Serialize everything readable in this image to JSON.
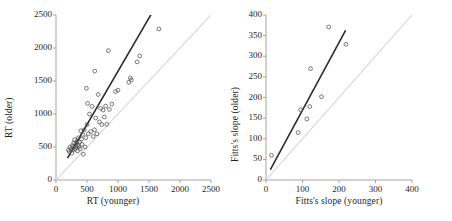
{
  "figure": {
    "background": "#ffffff",
    "ink": "#231f20",
    "fit_line_color": "#2b2b2b",
    "identity_line_color": "#d5d5d5",
    "marker_color": "#4d4d4d",
    "marker": "open-circle"
  },
  "chart_data": [
    {
      "type": "scatter",
      "title": "",
      "xlabel": "RT (younger)",
      "ylabel": "RT (older)",
      "xlim": [
        0,
        2500
      ],
      "ylim": [
        0,
        2500
      ],
      "xticks": [
        0,
        500,
        1000,
        1500,
        2000,
        2500
      ],
      "yticks": [
        0,
        500,
        1000,
        1500,
        2000,
        2500
      ],
      "xticklabels": [
        "0",
        "500",
        "1000",
        "1500",
        "2000",
        "2500"
      ],
      "yticklabels": [
        "0",
        "500",
        "1000",
        "1500",
        "2000",
        "2500"
      ],
      "grid": false,
      "legend": "none",
      "annotations": [],
      "lines": [
        {
          "name": "regression-fit",
          "style": "solid-dark",
          "x": [
            185,
            1540
          ],
          "y": [
            330,
            2520
          ]
        },
        {
          "name": "identity-line",
          "style": "solid-light",
          "x": [
            0,
            2500
          ],
          "y": [
            0,
            2500
          ]
        }
      ],
      "points": [
        {
          "x": 200,
          "y": 455
        },
        {
          "x": 215,
          "y": 430
        },
        {
          "x": 225,
          "y": 500
        },
        {
          "x": 245,
          "y": 470
        },
        {
          "x": 255,
          "y": 405
        },
        {
          "x": 265,
          "y": 520
        },
        {
          "x": 275,
          "y": 455
        },
        {
          "x": 285,
          "y": 560
        },
        {
          "x": 295,
          "y": 505
        },
        {
          "x": 300,
          "y": 610
        },
        {
          "x": 310,
          "y": 470
        },
        {
          "x": 320,
          "y": 545
        },
        {
          "x": 330,
          "y": 500
        },
        {
          "x": 340,
          "y": 585
        },
        {
          "x": 345,
          "y": 440
        },
        {
          "x": 355,
          "y": 530
        },
        {
          "x": 360,
          "y": 640
        },
        {
          "x": 370,
          "y": 505
        },
        {
          "x": 380,
          "y": 575
        },
        {
          "x": 390,
          "y": 470
        },
        {
          "x": 400,
          "y": 745
        },
        {
          "x": 410,
          "y": 620
        },
        {
          "x": 420,
          "y": 540
        },
        {
          "x": 430,
          "y": 690
        },
        {
          "x": 440,
          "y": 390
        },
        {
          "x": 455,
          "y": 760
        },
        {
          "x": 470,
          "y": 500
        },
        {
          "x": 480,
          "y": 640
        },
        {
          "x": 490,
          "y": 1390
        },
        {
          "x": 500,
          "y": 840
        },
        {
          "x": 510,
          "y": 1160
        },
        {
          "x": 520,
          "y": 700
        },
        {
          "x": 540,
          "y": 1000
        },
        {
          "x": 560,
          "y": 735
        },
        {
          "x": 580,
          "y": 1115
        },
        {
          "x": 600,
          "y": 660
        },
        {
          "x": 620,
          "y": 760
        },
        {
          "x": 625,
          "y": 1650
        },
        {
          "x": 640,
          "y": 940
        },
        {
          "x": 660,
          "y": 700
        },
        {
          "x": 680,
          "y": 1295
        },
        {
          "x": 700,
          "y": 880
        },
        {
          "x": 720,
          "y": 1085
        },
        {
          "x": 740,
          "y": 840
        },
        {
          "x": 760,
          "y": 1060
        },
        {
          "x": 780,
          "y": 955
        },
        {
          "x": 800,
          "y": 1120
        },
        {
          "x": 820,
          "y": 845
        },
        {
          "x": 845,
          "y": 1960
        },
        {
          "x": 860,
          "y": 1070
        },
        {
          "x": 900,
          "y": 1150
        },
        {
          "x": 960,
          "y": 1340
        },
        {
          "x": 1000,
          "y": 1360
        },
        {
          "x": 1175,
          "y": 1480
        },
        {
          "x": 1200,
          "y": 1545
        },
        {
          "x": 1215,
          "y": 1515
        },
        {
          "x": 1310,
          "y": 1790
        },
        {
          "x": 1350,
          "y": 1880
        },
        {
          "x": 1660,
          "y": 2290
        }
      ]
    },
    {
      "type": "scatter",
      "title": "",
      "xlabel": "Fitts's slope (younger)",
      "ylabel": "Fitts's slope (older)",
      "xlim": [
        0,
        400
      ],
      "ylim": [
        0,
        400
      ],
      "xticks": [
        0,
        100,
        200,
        300,
        400
      ],
      "yticks": [
        0,
        50,
        100,
        150,
        200,
        250,
        300,
        350,
        400
      ],
      "xticklabels": [
        "0",
        "100",
        "200",
        "300",
        "400"
      ],
      "yticklabels": [
        "0",
        "50",
        "100",
        "150",
        "200",
        "250",
        "300",
        "350",
        "400"
      ],
      "grid": false,
      "legend": "none",
      "annotations": [],
      "lines": [
        {
          "name": "regression-fit",
          "style": "solid-dark",
          "x": [
            12,
            218
          ],
          "y": [
            25,
            363
          ]
        },
        {
          "name": "identity-line",
          "style": "solid-light",
          "x": [
            0,
            400
          ],
          "y": [
            0,
            400
          ]
        }
      ],
      "points": [
        {
          "x": 15,
          "y": 60
        },
        {
          "x": 88,
          "y": 115
        },
        {
          "x": 95,
          "y": 170
        },
        {
          "x": 112,
          "y": 148
        },
        {
          "x": 120,
          "y": 178
        },
        {
          "x": 122,
          "y": 270
        },
        {
          "x": 152,
          "y": 202
        },
        {
          "x": 172,
          "y": 371
        },
        {
          "x": 219,
          "y": 329
        }
      ]
    }
  ]
}
